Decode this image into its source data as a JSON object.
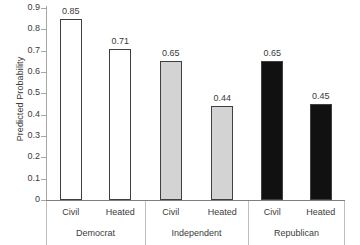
{
  "chart_data": {
    "type": "bar",
    "title": "",
    "xlabel": "",
    "ylabel": "Predicted Probability",
    "ylim": [
      0,
      0.9
    ],
    "grid": false,
    "legend": "none",
    "y_ticks": [
      "0.9",
      "0.8",
      "0.7",
      "0.6",
      "0.5",
      "0.4",
      "0.3",
      "0.2",
      "0.1",
      "0"
    ],
    "y_tick_values": [
      0.9,
      0.8,
      0.7,
      0.6,
      0.5,
      0.4,
      0.3,
      0.2,
      0.1,
      0
    ],
    "categories": [
      "Civil",
      "Heated",
      "Civil",
      "Heated",
      "Civil",
      "Heated"
    ],
    "values": [
      0.85,
      0.71,
      0.65,
      0.44,
      0.65,
      0.45
    ],
    "value_labels": [
      "0.85",
      "0.71",
      "0.65",
      "0.44",
      "0.65",
      "0.45"
    ],
    "groups": [
      {
        "label": "Democrat",
        "fill": "#ffffff",
        "bars": [
          {
            "tick": "Civil",
            "value": 0.85,
            "label": "0.85"
          },
          {
            "tick": "Heated",
            "value": 0.71,
            "label": "0.71"
          }
        ]
      },
      {
        "label": "Independent",
        "fill": "#d3d3d3",
        "bars": [
          {
            "tick": "Civil",
            "value": 0.65,
            "label": "0.65"
          },
          {
            "tick": "Heated",
            "value": 0.44,
            "label": "0.44"
          }
        ]
      },
      {
        "label": "Republican",
        "fill": "#111111",
        "bars": [
          {
            "tick": "Civil",
            "value": 0.65,
            "label": "0.65"
          },
          {
            "tick": "Heated",
            "value": 0.45,
            "label": "0.45"
          }
        ]
      }
    ],
    "colors": {
      "democrat_fill": "#ffffff",
      "independent_fill": "#d3d3d3",
      "republican_fill": "#111111",
      "bar_border": "#3f3f3f",
      "axis": "#a6a6a6",
      "text": "#3b3b3b",
      "background": "#ffffff"
    }
  }
}
